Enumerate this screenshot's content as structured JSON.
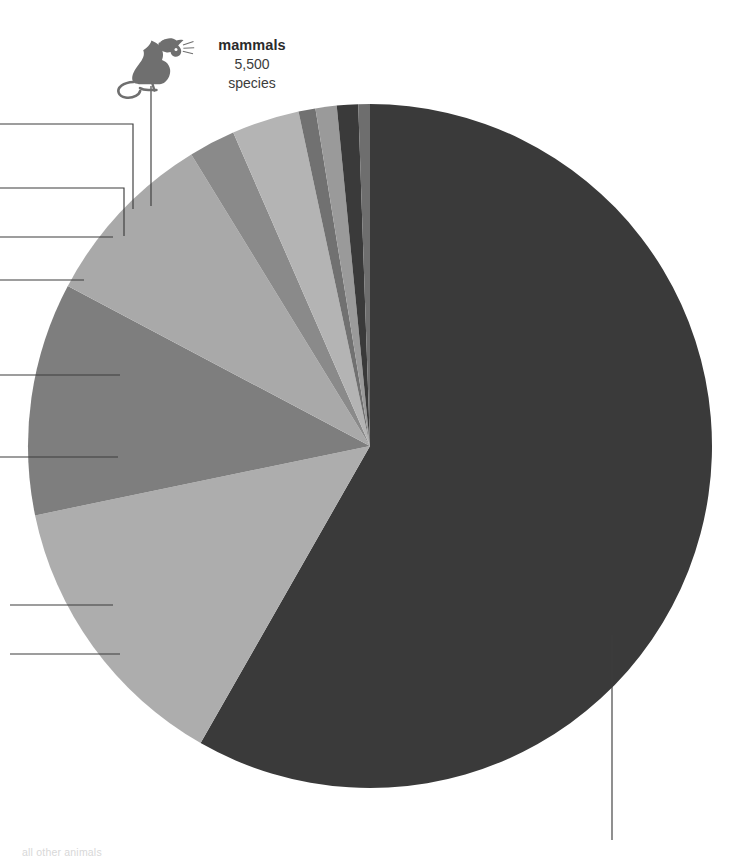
{
  "figure": {
    "background_color": "#ffffff",
    "leader_line_color": "#3d3d3d"
  },
  "callouts": {
    "mammals": {
      "name": "mammals",
      "count": "5,500",
      "unit": "species",
      "icon": "rat-icon"
    }
  },
  "footnote": {
    "text": "all other animals"
  },
  "chart_data": {
    "type": "pie",
    "title": "",
    "subtitle": "",
    "units": "species",
    "legend_position": "callout-leader-lines",
    "center": {
      "x": 370,
      "y": 446
    },
    "radius": 342,
    "start_angle_deg": 0,
    "direction": "clockwise",
    "labels": [
      "mammals",
      "birds",
      "reptiles",
      "amphibians",
      "fishes",
      "crustaceans",
      "molluscs",
      "arachnids",
      "other invertebrates",
      "insects"
    ],
    "values": [
      0.55,
      1.0,
      1.0,
      0.8,
      3.2,
      2.2,
      8.5,
      11.0,
      13.5,
      58.25
    ],
    "value_unit": "percent of total species",
    "colors": [
      "#6e6e6e",
      "#3a3a3a",
      "#9a9a9a",
      "#717171",
      "#b4b4b4",
      "#8a8a8a",
      "#a9a9a9",
      "#7e7e7e",
      "#adadad",
      "#3a3a3a"
    ],
    "annotations": [
      {
        "label": "mammals",
        "count": "5,500",
        "unit": "species"
      }
    ]
  },
  "leader_lines": [
    {
      "name": "leader-line-mammals",
      "kind": "vertical-stub"
    },
    {
      "name": "leader-line-1",
      "kind": "left-elbow"
    },
    {
      "name": "leader-line-2",
      "kind": "left-elbow"
    },
    {
      "name": "leader-line-3",
      "kind": "left-horizontal"
    },
    {
      "name": "leader-line-4",
      "kind": "left-horizontal"
    },
    {
      "name": "leader-line-5",
      "kind": "left-horizontal"
    },
    {
      "name": "leader-line-6",
      "kind": "left-horizontal"
    },
    {
      "name": "leader-line-7",
      "kind": "left-horizontal"
    },
    {
      "name": "leader-line-insects",
      "kind": "down-vertical"
    }
  ]
}
